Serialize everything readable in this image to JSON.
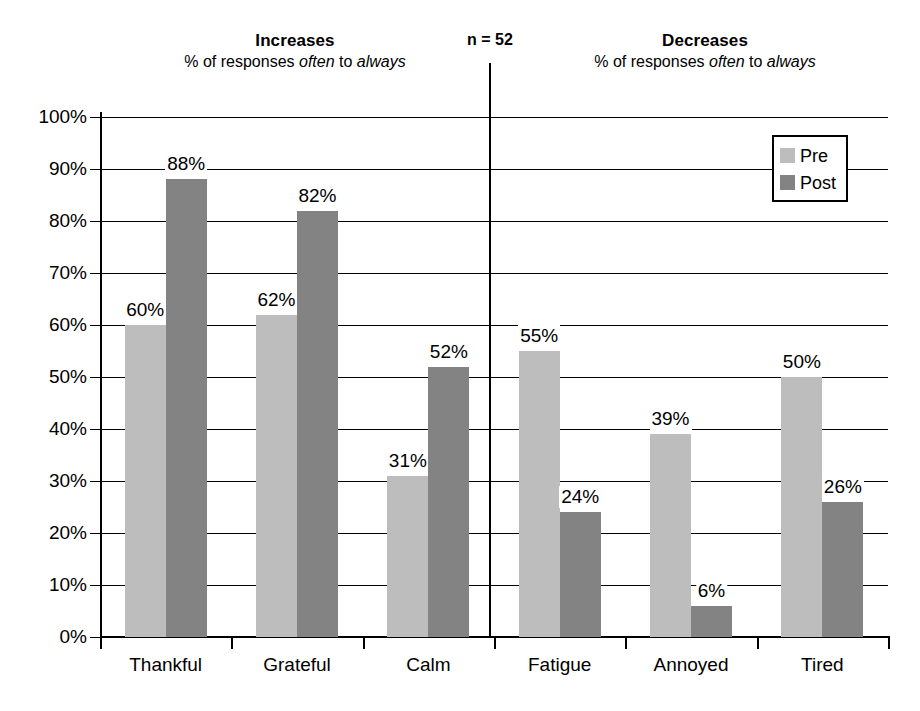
{
  "header": {
    "increases": {
      "title": "Increases",
      "subtitle_prefix": "% of responses ",
      "subtitle_italic_1": "often",
      "subtitle_middle": " to ",
      "subtitle_italic_2": "always"
    },
    "decreases": {
      "title": "Decreases",
      "subtitle_prefix": "% of responses ",
      "subtitle_italic_1": "often",
      "subtitle_middle": " to ",
      "subtitle_italic_2": "always"
    },
    "sample_size": "n = 52"
  },
  "legend": {
    "items": [
      {
        "label": "Pre",
        "color": "#bdbdbd"
      },
      {
        "label": "Post",
        "color": "#838383"
      }
    ]
  },
  "colors": {
    "pre": "#bdbdbd",
    "post": "#838383",
    "axis": "#000000",
    "background": "#ffffff"
  },
  "bottom_caption": "",
  "chart_data": {
    "type": "bar",
    "title": "",
    "subtitle": "",
    "xlabel": "",
    "ylabel": "",
    "ylim": [
      0,
      100
    ],
    "y_ticks": [
      "0%",
      "10%",
      "20%",
      "30%",
      "40%",
      "50%",
      "60%",
      "70%",
      "80%",
      "90%",
      "100%"
    ],
    "y_tick_values": [
      0,
      10,
      20,
      30,
      40,
      50,
      60,
      70,
      80,
      90,
      100
    ],
    "grid": true,
    "legend_position": "top-right",
    "categories": [
      "Thankful",
      "Grateful",
      "Calm",
      "Fatigue",
      "Annoyed",
      "Tired"
    ],
    "panels": [
      {
        "name": "Increases",
        "categories": [
          "Thankful",
          "Grateful",
          "Calm"
        ]
      },
      {
        "name": "Decreases",
        "categories": [
          "Fatigue",
          "Annoyed",
          "Tired"
        ]
      }
    ],
    "series": [
      {
        "name": "Pre",
        "values": [
          60,
          62,
          31,
          55,
          39,
          50
        ]
      },
      {
        "name": "Post",
        "values": [
          88,
          82,
          52,
          24,
          6,
          26
        ]
      }
    ],
    "data_labels": {
      "Pre": [
        "60%",
        "62%",
        "31%",
        "55%",
        "39%",
        "50%"
      ],
      "Post": [
        "88%",
        "82%",
        "52%",
        "24%",
        "6%",
        "26%"
      ]
    }
  }
}
